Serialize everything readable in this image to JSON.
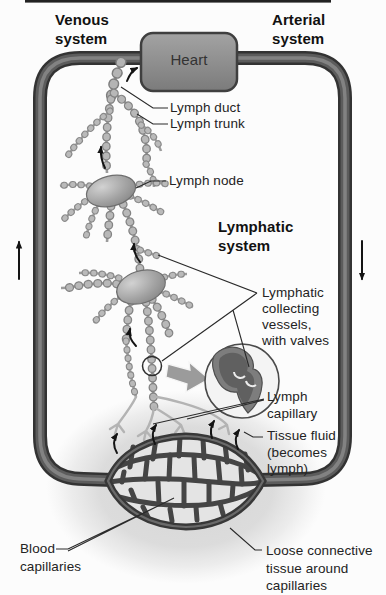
{
  "diagram": {
    "title_labels": {
      "venous": "Venous\nsystem",
      "arterial": "Arterial\nsystem"
    },
    "heart_label": "Heart",
    "section_heading": "Lymphatic\nsystem",
    "part_labels": {
      "lymph_duct": "Lymph duct",
      "lymph_trunk": "Lymph trunk",
      "lymph_node": "Lymph node",
      "collecting_vessels": "Lymphatic\ncollecting\nvessels,\nwith valves",
      "lymph_capillary": "Lymph\ncapillary",
      "tissue_fluid": "Tissue fluid\n(becomes\nlymph)",
      "blood_capillaries": "Blood\ncapillaries",
      "loose_connective": "Loose connective\ntissue around\ncapillaries"
    },
    "flow_icons": {
      "venous_flow_arrow": "up",
      "arterial_flow_arrow": "down",
      "lymph_flow_arrows": "up-toward-heart",
      "tissue_fluid_arrows": "up-into-lymph-capillaries"
    },
    "colors": {
      "background": "#fcfcfc",
      "tube_dark": "#333333",
      "tube_mid": "#5c5c5c",
      "heart_fill_top": "#a3a3a3",
      "heart_fill_bottom": "#7b7b7b",
      "vessel_bead": "#b8b8b8",
      "node_fill": "#949494",
      "bed_outline": "#383838",
      "bed_cell_fill": "#e4e4e4",
      "halo": "#b0b0b0",
      "label_text": "#232323"
    }
  }
}
